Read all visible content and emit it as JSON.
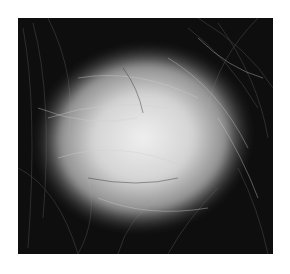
{
  "image": {
    "description": "Grayscale close-up photograph of a scalp showing a roughly oval bald patch surrounded by dark hair with lighter stray strands",
    "palette": {
      "background": "#ffffff",
      "hair_dark": "#0e0e0e",
      "scalp_light": "#d8d8d8",
      "scalp_center": "#ececec",
      "hair_light": "#bdbdbd"
    }
  }
}
